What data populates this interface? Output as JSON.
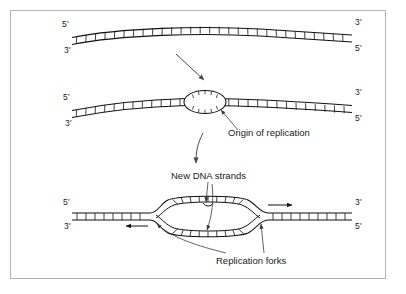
{
  "figure": {
    "background_color": "#ffffff",
    "border_color": "#b4b4b4",
    "ink_color": "#111111"
  },
  "panels": [
    {
      "id": "panel-1",
      "caption": "Unreplicated parental DNA double helix",
      "end_labels": {
        "left_top": "5'",
        "left_bottom": "3'",
        "right_top": "3'",
        "right_bottom": "5'"
      }
    },
    {
      "id": "panel-2",
      "caption": "Replication bubble forms at the origin",
      "end_labels": {
        "left_top": "5'",
        "left_bottom": "3'",
        "right_top": "3'",
        "right_bottom": "5'"
      }
    },
    {
      "id": "panel-3",
      "caption": "Bubble expands bidirectionally from two forks",
      "end_labels": {
        "left_top": "5'",
        "left_bottom": "3'",
        "right_top": "3'",
        "right_bottom": "5'"
      }
    }
  ],
  "annotations": {
    "origin": "Origin of replication",
    "new_strands": "New DNA strands",
    "forks": "Replication forks"
  },
  "icons": {
    "stage_arrow_1": "down-right-arrow-icon",
    "stage_arrow_2": "down-curved-arrow-icon",
    "fork_arrow_left": "left-arrow-icon",
    "fork_arrow_right": "right-arrow-icon"
  }
}
